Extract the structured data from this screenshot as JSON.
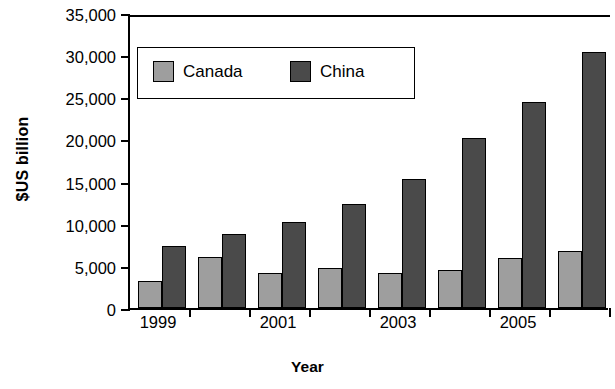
{
  "chart_data": {
    "type": "bar",
    "title": "",
    "xlabel": "Year",
    "ylabel": "$US billion",
    "categories": [
      "1999",
      "2000",
      "2001",
      "2002",
      "2003",
      "2004",
      "2005",
      "2006"
    ],
    "visible_tick_labels": [
      "1999",
      "",
      "2001",
      "",
      "2003",
      "",
      "2005",
      ""
    ],
    "series": [
      {
        "name": "Canada",
        "color": "#9e9e9e",
        "values": [
          3200,
          6100,
          4100,
          4700,
          4100,
          4500,
          5900,
          6800
        ]
      },
      {
        "name": "China",
        "color": "#4a4a4a",
        "values": [
          7400,
          8800,
          10200,
          12400,
          15300,
          20200,
          24500,
          30400
        ]
      }
    ],
    "ylim": [
      0,
      35000
    ],
    "yticks": [
      0,
      5000,
      10000,
      15000,
      20000,
      25000,
      30000,
      35000
    ],
    "ytick_labels": [
      "0",
      "5,000",
      "10,000",
      "15,000",
      "20,000",
      "25,000",
      "30,000",
      "35,000"
    ],
    "grid": false,
    "legend_position": "top-left-inside"
  },
  "legend": {
    "entries": [
      {
        "label": "Canada"
      },
      {
        "label": "China"
      }
    ]
  }
}
